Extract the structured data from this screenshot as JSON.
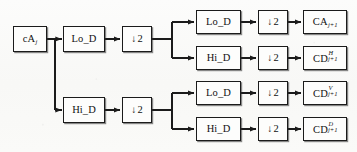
{
  "diagram": {
    "background_color": "#fbfbfa",
    "line_color": "#1b1b1b",
    "box_fill": "#fdfdfc",
    "nodes": {
      "input": {
        "base": "cA",
        "sub": "j",
        "sup": ""
      },
      "lo_stage1": {
        "base": "Lo_D",
        "sub": "",
        "sup": ""
      },
      "hi_stage1": {
        "base": "Hi_D",
        "sub": "",
        "sup": ""
      },
      "down_stage1_top": {
        "base": "2",
        "sub": "",
        "sup": "",
        "arrow": "↓"
      },
      "down_stage1_bottom": {
        "base": "2",
        "sub": "",
        "sup": "",
        "arrow": "↓"
      },
      "lo_r1": {
        "base": "Lo_D",
        "sub": "",
        "sup": ""
      },
      "hi_r2": {
        "base": "Hi_D",
        "sub": "",
        "sup": ""
      },
      "lo_r3": {
        "base": "Lo_D",
        "sub": "",
        "sup": ""
      },
      "hi_r4": {
        "base": "Hi_D",
        "sub": "",
        "sup": ""
      },
      "down_r1": {
        "base": "2",
        "sub": "",
        "sup": "",
        "arrow": "↓"
      },
      "down_r2": {
        "base": "2",
        "sub": "",
        "sup": "",
        "arrow": "↓"
      },
      "down_r3": {
        "base": "2",
        "sub": "",
        "sup": "",
        "arrow": "↓"
      },
      "down_r4": {
        "base": "2",
        "sub": "",
        "sup": "",
        "arrow": "↓"
      },
      "out_ca": {
        "base": "CA",
        "sub": "j+1",
        "sup": ""
      },
      "out_cd_h": {
        "base": "CD",
        "sub": "j+1",
        "sup": "H"
      },
      "out_cd_v": {
        "base": "CD",
        "sub": "j+1",
        "sup": "V"
      },
      "out_cd_d": {
        "base": "CD",
        "sub": "j+1",
        "sup": "D"
      }
    }
  }
}
